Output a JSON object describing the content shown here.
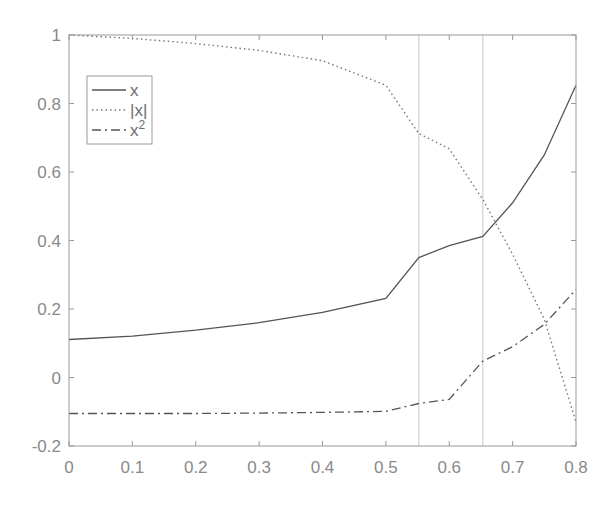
{
  "chart_data": {
    "type": "line",
    "title": "",
    "xlabel": "",
    "ylabel": "",
    "xlim": [
      0,
      0.8
    ],
    "ylim": [
      -0.2,
      1
    ],
    "grid": false,
    "legend_position": "upper-left",
    "x_ticks": [
      0,
      0.1,
      0.2,
      0.3,
      0.4,
      0.5,
      0.6,
      0.7,
      0.8
    ],
    "x_tick_labels": [
      "0",
      "0.1",
      "0.2",
      "0.3",
      "0.4",
      "0.5",
      "0.6",
      "0.7",
      "0.8"
    ],
    "y_ticks": [
      -0.2,
      0,
      0.2,
      0.4,
      0.6,
      0.8,
      1
    ],
    "y_tick_labels": [
      "-0.2",
      "0",
      "0.2",
      "0.4",
      "0.6",
      "0.8",
      "1"
    ],
    "x": [
      0,
      0.1,
      0.2,
      0.3,
      0.4,
      0.5,
      0.552,
      0.6,
      0.653,
      0.7,
      0.75,
      0.8
    ],
    "series": [
      {
        "name": "x",
        "style": "solid",
        "color": "#555555",
        "values": [
          0.111,
          0.121,
          0.138,
          0.16,
          0.19,
          0.231,
          0.35,
          0.385,
          0.412,
          0.51,
          0.65,
          0.853
        ]
      },
      {
        "name": "|x|",
        "style": "dotted",
        "color": "#777777",
        "values": [
          1.0,
          0.99,
          0.975,
          0.955,
          0.925,
          0.853,
          0.712,
          0.668,
          0.52,
          0.36,
          0.17,
          -0.13
        ]
      },
      {
        "name": "x²",
        "legend_base": "x",
        "legend_sup": "2",
        "style": "dashdot",
        "color": "#555555",
        "values": [
          -0.105,
          -0.105,
          -0.105,
          -0.104,
          -0.102,
          -0.099,
          -0.076,
          -0.064,
          0.048,
          0.09,
          0.155,
          0.257
        ]
      }
    ],
    "vertical_lines": [
      0.552,
      0.653
    ],
    "colors": {
      "axis": "#9a9a9a",
      "vline": "#c8c8c8",
      "legend_border": "#9a9a9a"
    }
  }
}
